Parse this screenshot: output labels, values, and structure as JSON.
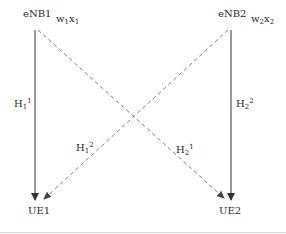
{
  "diagram": {
    "nodes": {
      "enb1": {
        "label": "eNB1",
        "precoder": {
          "w": "w",
          "w_sub": "1",
          "x": "x",
          "x_sub": "1"
        }
      },
      "enb2": {
        "label": "eNB2",
        "precoder": {
          "w": "w",
          "w_sub": "2",
          "x": "x",
          "x_sub": "2"
        }
      },
      "ue1": {
        "label": "UE1"
      },
      "ue2": {
        "label": "UE2"
      }
    },
    "edges": [
      {
        "id": "h11",
        "from": "eNB1",
        "to": "UE1",
        "style": "solid",
        "base": "H",
        "sub": "1",
        "sup": "1"
      },
      {
        "id": "h22",
        "from": "eNB2",
        "to": "UE2",
        "style": "solid",
        "base": "H",
        "sub": "2",
        "sup": "2"
      },
      {
        "id": "h12",
        "from": "eNB2",
        "to": "UE1",
        "style": "dashed",
        "base": "H",
        "sub": "1",
        "sup": "2"
      },
      {
        "id": "h21",
        "from": "eNB1",
        "to": "UE2",
        "style": "dashed",
        "base": "H",
        "sub": "2",
        "sup": "1"
      }
    ],
    "colors": {
      "solid_line": "#444444",
      "dashed_line": "#6e6e6e",
      "text": "#2a2a2a",
      "divider": "#d4d4d4"
    }
  }
}
